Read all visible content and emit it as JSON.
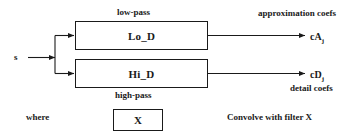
{
  "diagram": {
    "stroke_color": "#1a1a1a",
    "background_color": "#ffffff",
    "input": {
      "signal_label": "s"
    },
    "filters": [
      {
        "id": "lowpass",
        "box_label": "Lo_D",
        "annotation": "low-pass",
        "annotation_position": "above",
        "output_symbol": "cA",
        "output_subscript": "j",
        "output_annotation": "approximation coefs"
      },
      {
        "id": "highpass",
        "box_label": "Hi_D",
        "annotation": "high-pass",
        "annotation_position": "below",
        "output_symbol": "cD",
        "output_subscript": "j",
        "output_annotation": "detail coefs"
      }
    ],
    "legend": {
      "where_label": "where",
      "box_label": "X",
      "description": "Convolve with filter X"
    }
  }
}
